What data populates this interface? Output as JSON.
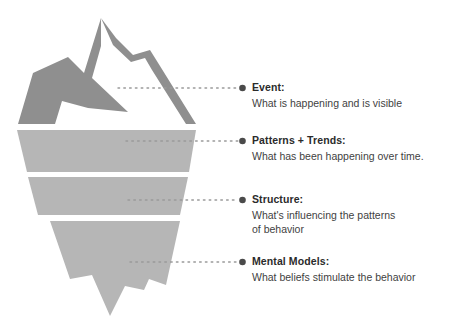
{
  "diagram": {
    "colors": {
      "peak_shadow": "#8f8f8f",
      "peak_ridge": "#8f8f8f",
      "submerged_body": "#b6b6b6",
      "heading_text": "#2b2b2b",
      "body_text": "#3f3f3f",
      "bullet_dot": "#4a4a4a",
      "leader_line": "#9a9a9a",
      "background": "#ffffff"
    },
    "graphic": {
      "name": "iceberg",
      "above_water_label": "tip of the iceberg",
      "submerged_band_count": 3
    },
    "callouts": [
      {
        "id": "event",
        "heading": "Event:",
        "body_lines": [
          "What is happening and is visible"
        ],
        "dot_y": 88,
        "leader_start_x": 118,
        "leader_end_x": 238
      },
      {
        "id": "patterns",
        "heading": "Patterns + Trends:",
        "body_lines": [
          "What has been happening over time."
        ],
        "dot_y": 141,
        "leader_start_x": 126,
        "leader_end_x": 238
      },
      {
        "id": "structure",
        "heading": "Structure:",
        "body_lines": [
          "What's influencing the patterns",
          "of behavior"
        ],
        "dot_y": 200,
        "leader_start_x": 128,
        "leader_end_x": 238
      },
      {
        "id": "mental_models",
        "heading": "Mental Models:",
        "body_lines": [
          "What beliefs stimulate the behavior"
        ],
        "dot_y": 262,
        "leader_start_x": 130,
        "leader_end_x": 238
      }
    ]
  }
}
